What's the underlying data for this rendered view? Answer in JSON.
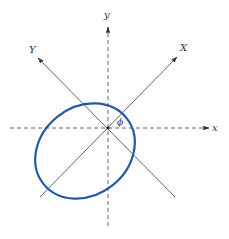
{
  "diagram": {
    "labels": {
      "x_axis": "x",
      "y_axis": "y",
      "X_axis": "X",
      "Y_axis": "Y",
      "angle": "ϕ"
    },
    "colors": {
      "ellipse_stroke": "#2458A8",
      "axis_stroke": "#555555",
      "label": "#333333"
    },
    "geometry": {
      "origin": [
        108,
        128
      ],
      "rotation_angle_deg": 45,
      "ellipse_center": [
        85,
        151
      ],
      "ellipse_rx": 53,
      "ellipse_ry": 44,
      "ellipse_tilt_deg": -38
    }
  }
}
